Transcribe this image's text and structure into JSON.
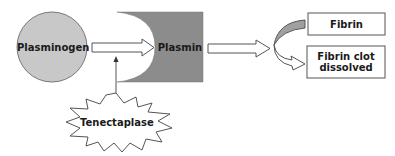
{
  "diagram": {
    "nodes": {
      "plasminogen": "Plasminogen",
      "plasmin": "Plasmin",
      "tenecteplase": "Tenectaplase",
      "fibrin": "Fibrin",
      "fibrin_clot_line1": "Fibrin clot",
      "fibrin_clot_line2": "dissolved"
    },
    "colors": {
      "plasminogen_fill": "#c8c8c8",
      "plasmin_fill": "#8c8c8c",
      "stroke": "#555555",
      "curve_fill": "#a0a0a0"
    }
  }
}
